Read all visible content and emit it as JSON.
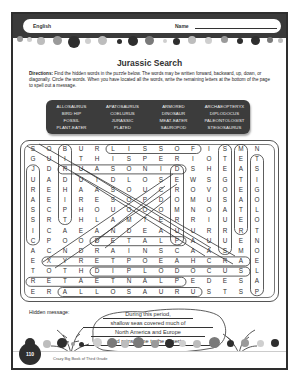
{
  "header": {
    "subject": "English",
    "name_label": "Name"
  },
  "title": "Jurassic Search",
  "directions": {
    "label": "Directions:",
    "text": " Find the hidden words in the puzzle below. The words may be written forward, backward, up, down, or diagonally. Circle the words. When you have located all the words, write the remaining letters at the bottom of the page to spell out a message."
  },
  "word_bank": [
    "ALLOSAURUS",
    "APATOSAURUS",
    "ARMORED",
    "ARCHAEOPTERYX",
    "BIRD HIP",
    "COELURUS",
    "DINOSAUR",
    "DIPLODOCUS",
    "FOSSIL",
    "JURASSIC",
    "MEAT-EATER",
    "PALEONTOLOGIST",
    "PLANT-EATER",
    "PLATED",
    "SAUROPOD",
    "STEGOSAURUS"
  ],
  "grid": [
    [
      "S",
      "O",
      "B",
      "U",
      "R",
      "L",
      "I",
      "S",
      "S",
      "O",
      "F",
      "I",
      "S",
      "M",
      "N"
    ],
    [
      "G",
      "U",
      "I",
      "T",
      "H",
      "I",
      "S",
      "P",
      "E",
      "R",
      "I",
      "O",
      "T",
      "E",
      "T"
    ],
    [
      "J",
      "D",
      "R",
      "U",
      "A",
      "S",
      "O",
      "N",
      "I",
      "D",
      "S",
      "H",
      "E",
      "A",
      "S"
    ],
    [
      "U",
      "A",
      "D",
      "U",
      "I",
      "D",
      "L",
      "O",
      "S",
      "E",
      "W",
      "S",
      "G",
      "T",
      "I"
    ],
    [
      "R",
      "E",
      "H",
      "A",
      "A",
      "S",
      "O",
      "U",
      "C",
      "R",
      "O",
      "V",
      "O",
      "E",
      "G"
    ],
    [
      "A",
      "E",
      "I",
      "R",
      "E",
      "S",
      "O",
      "P",
      "D",
      "O",
      "M",
      "U",
      "S",
      "A",
      "O"
    ],
    [
      "S",
      "C",
      "P",
      "H",
      "O",
      "U",
      "O",
      "O",
      "O",
      "M",
      "N",
      "O",
      "A",
      "T",
      "L"
    ],
    [
      "S",
      "R",
      "T",
      "H",
      "L",
      "A",
      "M",
      "T",
      "E",
      "R",
      "R",
      "I",
      "U",
      "E",
      "O"
    ],
    [
      "I",
      "C",
      "A",
      "E",
      "A",
      "N",
      "D",
      "E",
      "A",
      "U",
      "U",
      "R",
      "R",
      "R",
      "T"
    ],
    [
      "C",
      "P",
      "O",
      "O",
      "D",
      "E",
      "T",
      "A",
      "L",
      "P",
      "A",
      "U",
      "U",
      "E",
      "N"
    ],
    [
      "A",
      "C",
      "N",
      "D",
      "R",
      "A",
      "I",
      "N",
      "S",
      "C",
      "A",
      "A",
      "S",
      "M",
      "O"
    ],
    [
      "E",
      "X",
      "Y",
      "R",
      "E",
      "T",
      "P",
      "O",
      "E",
      "A",
      "H",
      "C",
      "R",
      "A",
      "E"
    ],
    [
      "T",
      "O",
      "T",
      "H",
      "D",
      "I",
      "P",
      "L",
      "O",
      "D",
      "O",
      "C",
      "U",
      "S",
      "L"
    ],
    [
      "R",
      "E",
      "T",
      "A",
      "E",
      "T",
      "N",
      "A",
      "L",
      "P",
      "E",
      "D",
      "E",
      "S",
      "A"
    ],
    [
      "E",
      "R",
      "A",
      "L",
      "L",
      "O",
      "S",
      "A",
      "U",
      "R",
      "U",
      "S",
      "T",
      "S",
      "P"
    ]
  ],
  "hidden_message": {
    "label": "Hidden message:",
    "lines": [
      "During this period,",
      "shallow seas covered much of",
      "North America and Europe",
      "and rains came to the deserts."
    ]
  },
  "footer": {
    "page_number": "110",
    "book_title": "Crazy Big Book of Third Grade"
  },
  "colors": {
    "band": "#3a3a3a",
    "word_bank_bg": "#3c3c3c",
    "dot_dark": "#2e2e2e",
    "dot_mid": "#7a7a7a",
    "dot_light": "#bdbdbd"
  }
}
